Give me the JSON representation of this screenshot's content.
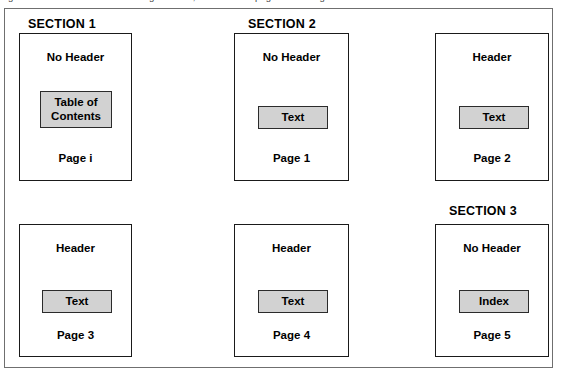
{
  "caption": {
    "text": "Figure: document structure showing sections, headers and page numbering"
  },
  "diagram": {
    "sections": [
      {
        "label": "SECTION 1"
      },
      {
        "label": "SECTION 2"
      },
      {
        "label": "SECTION 3"
      }
    ],
    "pages": [
      {
        "header": "No Header",
        "content": "Table of\nContents",
        "page_number": "Page i"
      },
      {
        "header": "No Header",
        "content": "Text",
        "page_number": "Page 1"
      },
      {
        "header": "Header",
        "content": "Text",
        "page_number": "Page 2"
      },
      {
        "header": "Header",
        "content": "Text",
        "page_number": "Page 3"
      },
      {
        "header": "Header",
        "content": "Text",
        "page_number": "Page 4"
      },
      {
        "header": "No Header",
        "content": "Index",
        "page_number": "Page 5"
      }
    ]
  },
  "colors": {
    "content_fill": "#d2d2d2",
    "box_border": "#1a1a1a",
    "frame_border": "#6f6f6f",
    "text": "#000000"
  }
}
